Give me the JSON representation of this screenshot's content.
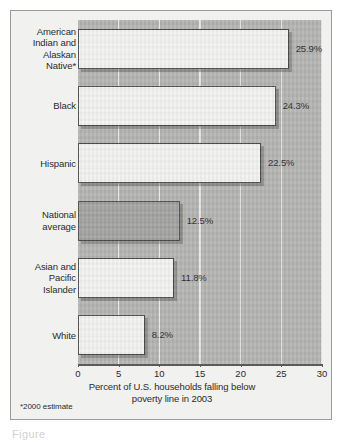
{
  "chart_data": {
    "type": "bar",
    "orientation": "horizontal",
    "title": "",
    "xlabel": "Percent of U.S. households falling below poverty line in 2003",
    "ylabel": "",
    "xlim": [
      0,
      30
    ],
    "xticks": [
      0,
      5,
      10,
      15,
      20,
      25,
      30
    ],
    "xtick_labels": [
      "0",
      "5",
      "10",
      "15",
      "20",
      "25",
      "30"
    ],
    "grid": true,
    "grid_axis": "x",
    "legend": false,
    "categories": [
      "American Indian and Alaskan Native*",
      "Black",
      "Hispanic",
      "National average",
      "Asian and Pacific Islander",
      "White"
    ],
    "values": [
      25.9,
      24.3,
      22.5,
      12.5,
      11.8,
      8.2
    ],
    "value_labels": [
      "25.9%",
      "24.3%",
      "22.5%",
      "12.5%",
      "11.8%",
      "8.2%"
    ],
    "highlighted_category": "National average",
    "footnote": "*2000 estimate",
    "colors": {
      "plot_background": "#b4b4b2",
      "figure_background": "#f1f1ef",
      "bar_fill": "#f4f4f2",
      "bar_highlight_fill": "#a3a3a1",
      "bar_outline": "#4a4a4a",
      "gridline": "#f2f2f0",
      "text": "#2b2b2b"
    }
  },
  "bars": [
    {
      "label_lines": [
        "American",
        "Indian and",
        "Alaskan",
        "Native*"
      ],
      "value_label": "25.9%",
      "value": 25.9,
      "style": "white"
    },
    {
      "label_lines": [
        "Black"
      ],
      "value_label": "24.3%",
      "value": 24.3,
      "style": "white"
    },
    {
      "label_lines": [
        "Hispanic"
      ],
      "value_label": "22.5%",
      "value": 22.5,
      "style": "white"
    },
    {
      "label_lines": [
        "National",
        "average"
      ],
      "value_label": "12.5%",
      "value": 12.5,
      "style": "shaded"
    },
    {
      "label_lines": [
        "Asian and",
        "Pacific",
        "Islander"
      ],
      "value_label": "11.8%",
      "value": 11.8,
      "style": "white"
    },
    {
      "label_lines": [
        "White"
      ],
      "value_label": "8.2%",
      "value": 8.2,
      "style": "white"
    }
  ],
  "axis": {
    "title_lines": [
      "Percent of U.S. households falling below",
      "poverty line in 2003"
    ],
    "tick_labels": [
      "0",
      "5",
      "10",
      "15",
      "20",
      "25",
      "30"
    ]
  },
  "footnote": "*2000 estimate",
  "caption": "Figure"
}
